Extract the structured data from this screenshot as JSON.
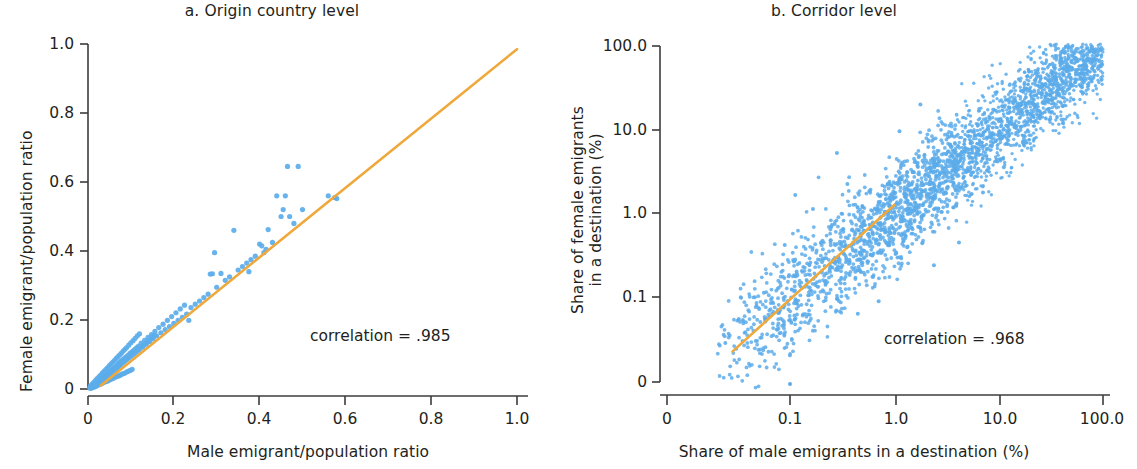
{
  "figure": {
    "background": "#ffffff",
    "point_color": "#5cacea",
    "line_color": "#efa83c",
    "axis_color": "#3c3c3c"
  },
  "panels": [
    {
      "id": "a",
      "title": "a. Origin country level",
      "xlabel": "Male emigrant/population ratio",
      "ylabel": "Female emigrant/population ratio",
      "ylabel_lines": [
        "Female emigrant/population ratio"
      ],
      "xticks": [
        "0",
        "0.2",
        "0.4",
        "0.6",
        "0.8",
        "1.0"
      ],
      "yticks": [
        "0",
        "0.2",
        "0.4",
        "0.6",
        "0.8",
        "1.0"
      ],
      "annotation": "correlation = .985"
    },
    {
      "id": "b",
      "title": "b. Corridor level",
      "xlabel": "Share of male emigrants in a destination (%)",
      "ylabel": "Share of female emigrants in a destination (%)",
      "ylabel_lines": [
        "Share of female emigrants",
        "in a destination (%)"
      ],
      "xticks": [
        "0",
        "0.1",
        "1.0",
        "10.0",
        "100.0"
      ],
      "yticks": [
        "0",
        "0.1",
        "1.0",
        "10.0",
        "100.0"
      ],
      "annotation": "correlation = .968"
    }
  ],
  "chart_data": [
    {
      "type": "scatter",
      "panel": "a",
      "title": "a. Origin country level",
      "xlabel": "Male emigrant/population ratio",
      "ylabel": "Female emigrant/population ratio",
      "xlim": [
        0,
        1.0
      ],
      "ylim": [
        0,
        1.0
      ],
      "xticks": [
        0,
        0.2,
        0.4,
        0.6,
        0.8,
        1.0
      ],
      "yticks": [
        0,
        0.2,
        0.4,
        0.6,
        0.8,
        1.0
      ],
      "xscale": "linear",
      "yscale": "linear",
      "grid": false,
      "legend": "none",
      "annotation": "correlation = .985",
      "correlation": 0.985,
      "fit_line": {
        "color": "#efa83c",
        "x": [
          0.03,
          1.0
        ],
        "y": [
          0.01,
          0.985
        ]
      },
      "points": [
        [
          0.004,
          0.003
        ],
        [
          0.006,
          0.004
        ],
        [
          0.008,
          0.006
        ],
        [
          0.009,
          0.005
        ],
        [
          0.011,
          0.008
        ],
        [
          0.012,
          0.007
        ],
        [
          0.013,
          0.011
        ],
        [
          0.014,
          0.009
        ],
        [
          0.015,
          0.012
        ],
        [
          0.016,
          0.01
        ],
        [
          0.017,
          0.014
        ],
        [
          0.018,
          0.012
        ],
        [
          0.019,
          0.017
        ],
        [
          0.02,
          0.013
        ],
        [
          0.021,
          0.018
        ],
        [
          0.022,
          0.015
        ],
        [
          0.023,
          0.02
        ],
        [
          0.024,
          0.016
        ],
        [
          0.025,
          0.022
        ],
        [
          0.026,
          0.018
        ],
        [
          0.027,
          0.024
        ],
        [
          0.028,
          0.019
        ],
        [
          0.029,
          0.026
        ],
        [
          0.03,
          0.021
        ],
        [
          0.031,
          0.028
        ],
        [
          0.032,
          0.023
        ],
        [
          0.033,
          0.03
        ],
        [
          0.034,
          0.025
        ],
        [
          0.035,
          0.032
        ],
        [
          0.036,
          0.027
        ],
        [
          0.037,
          0.034
        ],
        [
          0.038,
          0.029
        ],
        [
          0.039,
          0.036
        ],
        [
          0.04,
          0.031
        ],
        [
          0.041,
          0.038
        ],
        [
          0.042,
          0.033
        ],
        [
          0.043,
          0.041
        ],
        [
          0.044,
          0.035
        ],
        [
          0.045,
          0.043
        ],
        [
          0.046,
          0.038
        ],
        [
          0.047,
          0.045
        ],
        [
          0.048,
          0.04
        ],
        [
          0.049,
          0.047
        ],
        [
          0.05,
          0.042
        ],
        [
          0.051,
          0.049
        ],
        [
          0.052,
          0.044
        ],
        [
          0.053,
          0.052
        ],
        [
          0.054,
          0.046
        ],
        [
          0.055,
          0.054
        ],
        [
          0.056,
          0.049
        ],
        [
          0.057,
          0.056
        ],
        [
          0.058,
          0.051
        ],
        [
          0.059,
          0.058
        ],
        [
          0.06,
          0.053
        ],
        [
          0.061,
          0.061
        ],
        [
          0.062,
          0.055
        ],
        [
          0.063,
          0.063
        ],
        [
          0.064,
          0.058
        ],
        [
          0.065,
          0.065
        ],
        [
          0.066,
          0.06
        ],
        [
          0.067,
          0.068
        ],
        [
          0.068,
          0.062
        ],
        [
          0.069,
          0.07
        ],
        [
          0.07,
          0.064
        ],
        [
          0.071,
          0.073
        ],
        [
          0.072,
          0.067
        ],
        [
          0.073,
          0.075
        ],
        [
          0.074,
          0.069
        ],
        [
          0.075,
          0.078
        ],
        [
          0.076,
          0.071
        ],
        [
          0.078,
          0.082
        ],
        [
          0.08,
          0.075
        ],
        [
          0.082,
          0.086
        ],
        [
          0.084,
          0.079
        ],
        [
          0.086,
          0.09
        ],
        [
          0.088,
          0.083
        ],
        [
          0.09,
          0.094
        ],
        [
          0.092,
          0.087
        ],
        [
          0.094,
          0.098
        ],
        [
          0.096,
          0.091
        ],
        [
          0.098,
          0.103
        ],
        [
          0.1,
          0.095
        ],
        [
          0.102,
          0.107
        ],
        [
          0.104,
          0.099
        ],
        [
          0.106,
          0.111
        ],
        [
          0.108,
          0.103
        ],
        [
          0.11,
          0.116
        ],
        [
          0.112,
          0.107
        ],
        [
          0.114,
          0.12
        ],
        [
          0.116,
          0.111
        ],
        [
          0.118,
          0.124
        ],
        [
          0.12,
          0.115
        ],
        [
          0.124,
          0.133
        ],
        [
          0.128,
          0.122
        ],
        [
          0.132,
          0.141
        ],
        [
          0.136,
          0.13
        ],
        [
          0.14,
          0.15
        ],
        [
          0.144,
          0.138
        ],
        [
          0.148,
          0.158
        ],
        [
          0.152,
          0.146
        ],
        [
          0.156,
          0.167
        ],
        [
          0.16,
          0.154
        ],
        [
          0.165,
          0.178
        ],
        [
          0.17,
          0.163
        ],
        [
          0.175,
          0.188
        ],
        [
          0.18,
          0.172
        ],
        [
          0.185,
          0.199
        ],
        [
          0.19,
          0.181
        ],
        [
          0.195,
          0.21
        ],
        [
          0.2,
          0.19
        ],
        [
          0.205,
          0.221
        ],
        [
          0.21,
          0.199
        ],
        [
          0.215,
          0.232
        ],
        [
          0.22,
          0.208
        ],
        [
          0.225,
          0.243
        ],
        [
          0.23,
          0.217
        ],
        [
          0.235,
          0.199
        ],
        [
          0.24,
          0.236
        ],
        [
          0.25,
          0.246
        ],
        [
          0.26,
          0.255
        ],
        [
          0.27,
          0.265
        ],
        [
          0.28,
          0.275
        ],
        [
          0.285,
          0.333
        ],
        [
          0.29,
          0.334
        ],
        [
          0.295,
          0.395
        ],
        [
          0.3,
          0.295
        ],
        [
          0.31,
          0.335
        ],
        [
          0.32,
          0.315
        ],
        [
          0.33,
          0.325
        ],
        [
          0.34,
          0.46
        ],
        [
          0.35,
          0.345
        ],
        [
          0.36,
          0.355
        ],
        [
          0.37,
          0.365
        ],
        [
          0.375,
          0.34
        ],
        [
          0.38,
          0.375
        ],
        [
          0.39,
          0.385
        ],
        [
          0.4,
          0.42
        ],
        [
          0.405,
          0.415
        ],
        [
          0.41,
          0.395
        ],
        [
          0.415,
          0.405
        ],
        [
          0.42,
          0.462
        ],
        [
          0.43,
          0.425
        ],
        [
          0.44,
          0.56
        ],
        [
          0.45,
          0.5
        ],
        [
          0.455,
          0.52
        ],
        [
          0.46,
          0.56
        ],
        [
          0.465,
          0.645
        ],
        [
          0.47,
          0.5
        ],
        [
          0.48,
          0.48
        ],
        [
          0.49,
          0.645
        ],
        [
          0.5,
          0.52
        ],
        [
          0.56,
          0.56
        ],
        [
          0.575,
          0.555
        ],
        [
          0.58,
          0.552
        ],
        [
          0.006,
          0.009
        ],
        [
          0.01,
          0.015
        ],
        [
          0.014,
          0.02
        ],
        [
          0.018,
          0.026
        ],
        [
          0.022,
          0.031
        ],
        [
          0.026,
          0.036
        ],
        [
          0.03,
          0.041
        ],
        [
          0.034,
          0.047
        ],
        [
          0.038,
          0.052
        ],
        [
          0.042,
          0.057
        ],
        [
          0.046,
          0.062
        ],
        [
          0.05,
          0.068
        ],
        [
          0.054,
          0.073
        ],
        [
          0.058,
          0.078
        ],
        [
          0.062,
          0.083
        ],
        [
          0.066,
          0.089
        ],
        [
          0.07,
          0.094
        ],
        [
          0.074,
          0.099
        ],
        [
          0.078,
          0.104
        ],
        [
          0.082,
          0.11
        ],
        [
          0.086,
          0.115
        ],
        [
          0.09,
          0.12
        ],
        [
          0.095,
          0.127
        ],
        [
          0.1,
          0.134
        ],
        [
          0.105,
          0.14
        ],
        [
          0.11,
          0.147
        ],
        [
          0.115,
          0.154
        ],
        [
          0.12,
          0.16
        ],
        [
          0.125,
          0.122
        ],
        [
          0.13,
          0.128
        ],
        [
          0.135,
          0.133
        ],
        [
          0.14,
          0.139
        ],
        [
          0.145,
          0.144
        ],
        [
          0.15,
          0.15
        ],
        [
          0.155,
          0.155
        ],
        [
          0.007,
          0.002
        ],
        [
          0.011,
          0.004
        ],
        [
          0.015,
          0.006
        ],
        [
          0.019,
          0.008
        ],
        [
          0.023,
          0.011
        ],
        [
          0.027,
          0.013
        ],
        [
          0.031,
          0.015
        ],
        [
          0.035,
          0.018
        ],
        [
          0.039,
          0.02
        ],
        [
          0.043,
          0.022
        ],
        [
          0.047,
          0.024
        ],
        [
          0.051,
          0.027
        ],
        [
          0.055,
          0.029
        ],
        [
          0.059,
          0.031
        ],
        [
          0.063,
          0.034
        ],
        [
          0.067,
          0.036
        ],
        [
          0.071,
          0.038
        ],
        [
          0.075,
          0.04
        ],
        [
          0.079,
          0.043
        ],
        [
          0.083,
          0.045
        ],
        [
          0.087,
          0.047
        ],
        [
          0.091,
          0.05
        ],
        [
          0.095,
          0.052
        ],
        [
          0.099,
          0.054
        ],
        [
          0.103,
          0.057
        ]
      ],
      "n_points": 205,
      "description": "Country-level scatter of female vs male emigrant/population ratios with a 45-degree fitted orange line; points cluster tightly near the origin."
    },
    {
      "type": "scatter",
      "panel": "b",
      "title": "b. Corridor level",
      "xlabel": "Share of male emigrants in a destination (%)",
      "ylabel": "Share of female emigrants in a destination (%)",
      "xscale": "log",
      "yscale": "log",
      "xticks": [
        0,
        0.1,
        1.0,
        10.0,
        100.0
      ],
      "yticks": [
        0,
        0.1,
        1.0,
        10.0,
        100.0
      ],
      "grid": false,
      "legend": "none",
      "annotation": "correlation = .968",
      "correlation": 0.968,
      "fit_line": {
        "color": "#efa83c",
        "x_decades": [
          -1.55,
          0.0
        ],
        "y_decades": [
          -1.65,
          0.1
        ]
      },
      "n_points": 3000,
      "cluster": {
        "x_decade_range": [
          -1.7,
          2.0
        ],
        "spread_sd_decades": 0.18,
        "slope": 1.0,
        "densest_x_decades": [
          -0.9,
          1.6
        ]
      },
      "description": "Corridor-level scatter on log-log axes, dense elongated cloud along the 45-degree line from about 0.02% to 100%, with orange fitted line through the lower-left portion."
    }
  ]
}
